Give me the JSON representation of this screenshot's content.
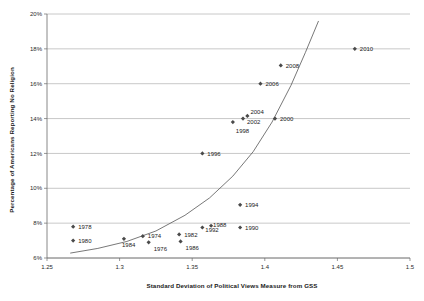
{
  "chart_data": {
    "type": "scatter",
    "title": "",
    "xlabel": "Standard Deviation of Political Views Measure from GSS",
    "ylabel": "Percentage of Americans Reporting No Religion",
    "xlim": [
      1.25,
      1.5
    ],
    "ylim": [
      6,
      20
    ],
    "xticks": [
      "1.25",
      "1.3",
      "1.35",
      "1.4",
      "1.45",
      "1.5"
    ],
    "xtick_values": [
      1.25,
      1.3,
      1.35,
      1.4,
      1.45,
      1.5
    ],
    "yticks": [
      "6%",
      "8%",
      "10%",
      "12%",
      "14%",
      "16%",
      "18%",
      "20%"
    ],
    "ytick_values": [
      6,
      8,
      10,
      12,
      14,
      16,
      18,
      20
    ],
    "grid": "horizontal",
    "legend": "none",
    "points": [
      {
        "label": "1978",
        "x": 1.268,
        "y": 7.8,
        "label_dx": 5,
        "label_dy": 2.2
      },
      {
        "label": "1980",
        "x": 1.268,
        "y": 7.0,
        "label_dx": 5,
        "label_dy": 2.2
      },
      {
        "label": "1984",
        "x": 1.303,
        "y": 7.1,
        "label_dx": -2,
        "label_dy": 8.5
      },
      {
        "label": "1974",
        "x": 1.316,
        "y": 7.25,
        "label_dx": 5,
        "label_dy": 2.2
      },
      {
        "label": "1976",
        "x": 1.32,
        "y": 6.9,
        "label_dx": 5,
        "label_dy": 8.5
      },
      {
        "label": "1982",
        "x": 1.341,
        "y": 7.35,
        "label_dx": 5,
        "label_dy": 2.2
      },
      {
        "label": "1986",
        "x": 1.342,
        "y": 6.95,
        "label_dx": 5,
        "label_dy": 8.5
      },
      {
        "label": "1992",
        "x": 1.357,
        "y": 7.75,
        "label_dx": 3,
        "label_dy": 4.5
      },
      {
        "label": "1988",
        "x": 1.363,
        "y": 7.85,
        "label_dx": 2,
        "label_dy": 1.0
      },
      {
        "label": "1990",
        "x": 1.383,
        "y": 7.75,
        "label_dx": 5,
        "label_dy": 2.2
      },
      {
        "label": "1994",
        "x": 1.383,
        "y": 9.05,
        "label_dx": 5,
        "label_dy": 2.2
      },
      {
        "label": "1996",
        "x": 1.357,
        "y": 12.0,
        "label_dx": 5,
        "label_dy": 2.2
      },
      {
        "label": "1998",
        "x": 1.378,
        "y": 13.8,
        "label_dx": 3,
        "label_dy": 10.5
      },
      {
        "label": "2002",
        "x": 1.385,
        "y": 14.0,
        "label_dx": 4,
        "label_dy": 5.5
      },
      {
        "label": "2004",
        "x": 1.388,
        "y": 14.15,
        "label_dx": 3,
        "label_dy": -1.5
      },
      {
        "label": "2000",
        "x": 1.407,
        "y": 14.0,
        "label_dx": 5,
        "label_dy": 2.2
      },
      {
        "label": "2006",
        "x": 1.397,
        "y": 16.0,
        "label_dx": 5,
        "label_dy": 2.2
      },
      {
        "label": "2008",
        "x": 1.411,
        "y": 17.05,
        "label_dx": 5,
        "label_dy": 2.2
      },
      {
        "label": "2010",
        "x": 1.462,
        "y": 18.0,
        "label_dx": 5,
        "label_dy": 2.2
      }
    ],
    "trend": {
      "name": "exponential-fit",
      "x_points": [
        1.266,
        1.285,
        1.305,
        1.325,
        1.345,
        1.362,
        1.378,
        1.392,
        1.405,
        1.418,
        1.428,
        1.437
      ],
      "y_points": [
        6.28,
        6.55,
        6.95,
        7.55,
        8.45,
        9.45,
        10.7,
        12.1,
        13.8,
        15.9,
        17.8,
        19.6
      ]
    }
  }
}
